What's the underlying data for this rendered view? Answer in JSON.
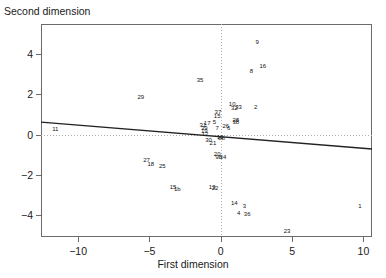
{
  "chart_data": {
    "type": "scatter",
    "title": "",
    "xlabel": "First dimension",
    "ylabel": "Second dimension",
    "xlim": [
      -12.6,
      10.6
    ],
    "ylim": [
      -5.1,
      5.5
    ],
    "xticks": [
      -10,
      -5,
      0,
      5,
      10
    ],
    "xticklabels": [
      "−10",
      "−5",
      "0",
      "5",
      "10"
    ],
    "yticks": [
      -4,
      -2,
      0,
      2,
      4
    ],
    "yticklabels": [
      "−4",
      "−2",
      "0",
      "2",
      "4"
    ],
    "grid": "dotted reference lines at x=0 and y=0",
    "point_marker": "text-label",
    "fit_line": {
      "label": "regression-line",
      "x_start": -12.6,
      "y_start": 0.62,
      "x_end": 10.6,
      "y_end": -0.72,
      "color": "#222222"
    },
    "points": [
      {
        "label": "11",
        "x": -11.6,
        "y": 0.28
      },
      {
        "label": "29",
        "x": -5.6,
        "y": 1.85
      },
      {
        "label": "27",
        "x": -5.2,
        "y": -1.25
      },
      {
        "label": "18",
        "x": -4.9,
        "y": -1.45
      },
      {
        "label": "25",
        "x": -4.1,
        "y": -1.55
      },
      {
        "label": "35",
        "x": -1.45,
        "y": 2.72
      },
      {
        "label": "15",
        "x": -3.35,
        "y": -2.62
      },
      {
        "label": "1b",
        "x": -3.05,
        "y": -2.72
      },
      {
        "label": "31",
        "x": -1.25,
        "y": 0.45
      },
      {
        "label": "17",
        "x": -0.95,
        "y": 0.58
      },
      {
        "label": "5",
        "x": -0.45,
        "y": 0.6
      },
      {
        "label": "37",
        "x": -0.2,
        "y": 1.12
      },
      {
        "label": "15",
        "x": -0.25,
        "y": 0.92
      },
      {
        "label": "39",
        "x": -1.15,
        "y": 0.3
      },
      {
        "label": "19",
        "x": -1.15,
        "y": 0.2
      },
      {
        "label": "7",
        "x": -0.25,
        "y": 0.3
      },
      {
        "label": "26",
        "x": 0.35,
        "y": 0.42
      },
      {
        "label": "6",
        "x": 0.55,
        "y": 0.32
      },
      {
        "label": "12",
        "x": -1.1,
        "y": 0.02
      },
      {
        "label": "30",
        "x": -0.85,
        "y": -0.28
      },
      {
        "label": "21",
        "x": -0.55,
        "y": -0.42
      },
      {
        "label": "13",
        "x": -0.05,
        "y": -0.12
      },
      {
        "label": "8b",
        "x": 0.05,
        "y": -0.18
      },
      {
        "label": "20",
        "x": -0.25,
        "y": -0.95
      },
      {
        "label": "9b",
        "x": -0.15,
        "y": -1.12
      },
      {
        "label": "34",
        "x": 0.15,
        "y": -1.1
      },
      {
        "label": "19",
        "x": -0.6,
        "y": -2.62
      },
      {
        "label": "22",
        "x": -0.4,
        "y": -2.65
      },
      {
        "label": "10",
        "x": 0.8,
        "y": 1.52
      },
      {
        "label": "32",
        "x": 0.95,
        "y": 1.32
      },
      {
        "label": "33",
        "x": 1.25,
        "y": 1.35
      },
      {
        "label": "28",
        "x": 1.05,
        "y": 0.72
      },
      {
        "label": "38",
        "x": 1.05,
        "y": 0.6
      },
      {
        "label": "2",
        "x": 2.45,
        "y": 1.38
      },
      {
        "label": "8",
        "x": 2.15,
        "y": 3.18
      },
      {
        "label": "16",
        "x": 2.95,
        "y": 3.42
      },
      {
        "label": "9",
        "x": 2.55,
        "y": 4.62
      },
      {
        "label": "14",
        "x": 0.95,
        "y": -3.42
      },
      {
        "label": "3",
        "x": 1.65,
        "y": -3.58
      },
      {
        "label": "4",
        "x": 1.25,
        "y": -3.92
      },
      {
        "label": "36",
        "x": 1.85,
        "y": -3.95
      },
      {
        "label": "23",
        "x": 4.65,
        "y": -4.82
      },
      {
        "label": "1",
        "x": 9.75,
        "y": -3.55
      }
    ]
  }
}
